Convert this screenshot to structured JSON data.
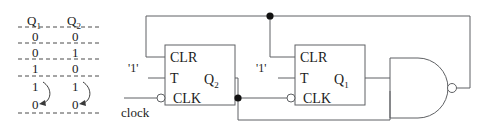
{
  "figure": {
    "kind": "sequential-logic-circuit-with-state-table"
  },
  "state_table": {
    "headers": [
      "Q",
      "1",
      "Q",
      "2"
    ],
    "header_q1_base": "Q",
    "header_q1_sub": "1",
    "header_q2_base": "Q",
    "header_q2_sub": "2",
    "rows": [
      {
        "q1": "0",
        "q2": "0"
      },
      {
        "q1": "0",
        "q2": "1"
      },
      {
        "q1": "1",
        "q2": "0"
      },
      {
        "q1": "1",
        "q2": "1"
      },
      {
        "q1": "0",
        "q2": "0"
      }
    ],
    "wrap_arrow_note": "curved arrow from last 1 row back to 0 row in each column"
  },
  "flipflops": [
    {
      "id": "ff1",
      "clr_label": "CLR",
      "t_label": "T",
      "clk_label": "CLK",
      "out_base": "Q",
      "out_sub": "2",
      "clk_inverting": true,
      "tied_input_label": "'1'"
    },
    {
      "id": "ff2",
      "clr_label": "CLR",
      "t_label": "T",
      "clk_label": "CLK",
      "out_base": "Q",
      "out_sub": "1",
      "clk_inverting": true,
      "tied_input_label": "'1'"
    }
  ],
  "gate": {
    "type": "nand",
    "inputs": 2,
    "has_output_bubble": true
  },
  "signals": {
    "clock_label": "clock",
    "logic_one_label": "'1'"
  },
  "colors": {
    "wire": "#5f6164",
    "text": "#1b1b1b",
    "junction": "#111111",
    "background": "#ffffff"
  }
}
